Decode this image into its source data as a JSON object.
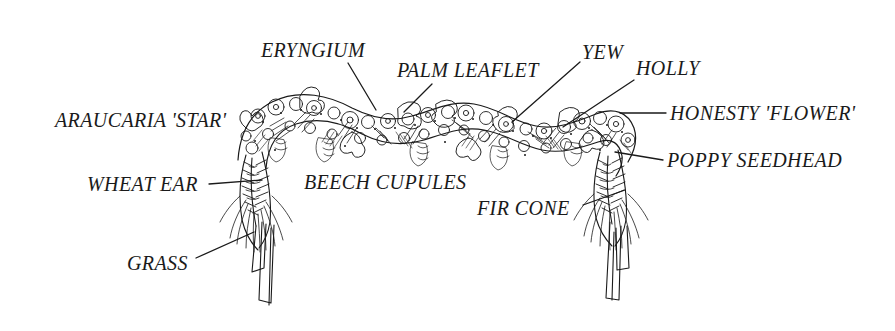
{
  "figure": {
    "kind": "botanical-line-drawing",
    "background_color": "#ffffff",
    "ink_color": "#1a1a1a",
    "width": 895,
    "height": 331
  },
  "labels": [
    {
      "id": "araucaria",
      "text": "ARAUCARIA 'STAR'",
      "align": "left"
    },
    {
      "id": "eryngium",
      "text": "ERYNGIUM",
      "align": "left"
    },
    {
      "id": "palm",
      "text": "PALM LEAFLET",
      "align": "left"
    },
    {
      "id": "yew",
      "text": "YEW",
      "align": "left"
    },
    {
      "id": "holly",
      "text": "HOLLY",
      "align": "left"
    },
    {
      "id": "honesty",
      "text": "HONESTY 'FLOWER'",
      "align": "left"
    },
    {
      "id": "poppy",
      "text": "POPPY SEEDHEAD",
      "align": "left"
    },
    {
      "id": "wheat",
      "text": "WHEAT EAR",
      "align": "left"
    },
    {
      "id": "beech",
      "text": "BEECH CUPULES",
      "align": "left"
    },
    {
      "id": "fircone",
      "text": "FIR CONE",
      "align": "left"
    },
    {
      "id": "grass",
      "text": "GRASS",
      "align": "left"
    }
  ],
  "leader_lines": [
    {
      "id": "eryngium",
      "x1": 348,
      "y1": 63,
      "x2": 376,
      "y2": 110
    },
    {
      "id": "palm",
      "x1": 432,
      "y1": 84,
      "x2": 404,
      "y2": 112
    },
    {
      "id": "yew",
      "x1": 580,
      "y1": 62,
      "x2": 512,
      "y2": 122
    },
    {
      "id": "holly",
      "x1": 634,
      "y1": 80,
      "x2": 563,
      "y2": 127
    },
    {
      "id": "honesty",
      "x1": 666,
      "y1": 113,
      "x2": 620,
      "y2": 113
    },
    {
      "id": "poppy",
      "x1": 663,
      "y1": 160,
      "x2": 615,
      "y2": 152
    },
    {
      "id": "wheat",
      "x1": 209,
      "y1": 184,
      "x2": 262,
      "y2": 180
    },
    {
      "id": "fircone",
      "x1": 583,
      "y1": 205,
      "x2": 625,
      "y2": 190
    },
    {
      "id": "grass",
      "x1": 196,
      "y1": 258,
      "x2": 254,
      "y2": 232
    }
  ]
}
